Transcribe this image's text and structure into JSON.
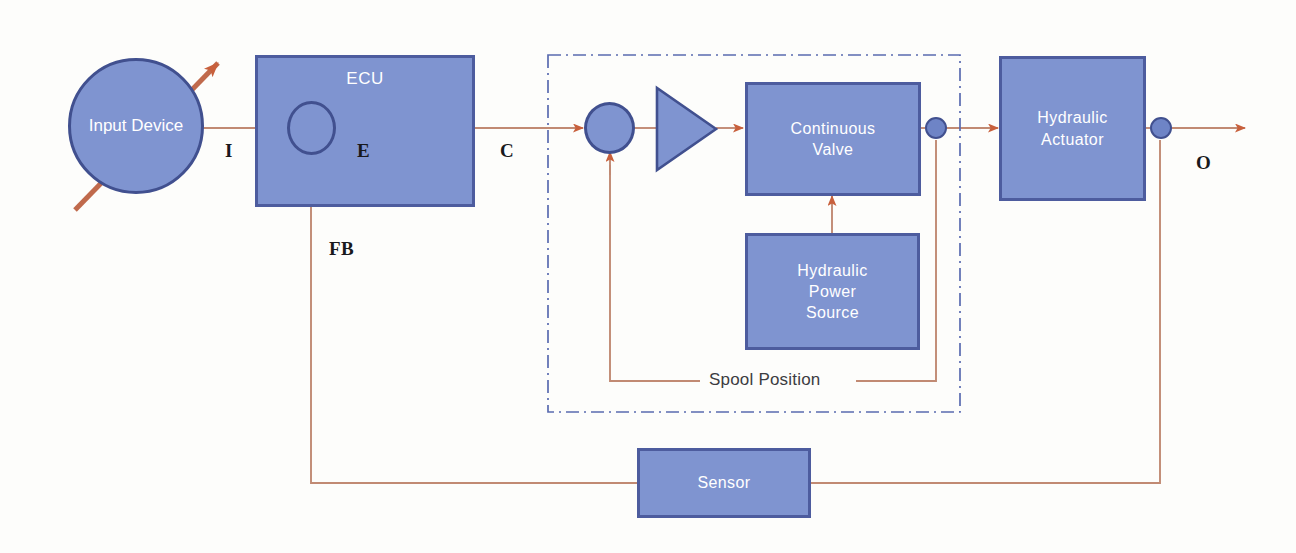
{
  "diagram": {
    "type": "block-diagram",
    "colors": {
      "block_fill": "#7f94d0",
      "block_border": "#4d5c9e",
      "signal_line": "#c18a73",
      "arrowhead": "#c8603c",
      "dashed_boundary": "#5a6bb0",
      "block_text": "#ffffff",
      "signal_label_text": "#19191c",
      "background": "#fdfdfb"
    },
    "blocks": [
      {
        "id": "input-device",
        "label": "Input Device",
        "lines": [
          "Input",
          "Device"
        ],
        "shape": "circle"
      },
      {
        "id": "ecu",
        "label": "ECU",
        "lines": [
          "ECU"
        ],
        "shape": "rect"
      },
      {
        "id": "ecu-summing",
        "label": "Summing Junction",
        "lines": [],
        "shape": "circle-cross"
      },
      {
        "id": "ecu-amplifier",
        "label": "Amplifier",
        "lines": [],
        "shape": "triangle-outline"
      },
      {
        "id": "valve-summing",
        "label": "Valve Summing Junction",
        "lines": [],
        "shape": "circle-cross"
      },
      {
        "id": "valve-amplifier",
        "label": "Valve Amplifier",
        "lines": [],
        "shape": "triangle-filled"
      },
      {
        "id": "continuous-valve",
        "label": "Continuous Valve",
        "lines": [
          "Continuous",
          "Valve"
        ],
        "shape": "rect"
      },
      {
        "id": "hydraulic-power-source",
        "label": "Hydraulic Power Source",
        "lines": [
          "Hydraulic",
          "Power",
          "Source"
        ],
        "shape": "rect"
      },
      {
        "id": "hydraulic-actuator",
        "label": "Hydraulic Actuator",
        "lines": [
          "Hydraulic",
          "Actuator"
        ],
        "shape": "rect"
      },
      {
        "id": "sensor",
        "label": "Sensor",
        "lines": [
          "Sensor"
        ],
        "shape": "rect"
      }
    ],
    "signal_labels": [
      {
        "id": "I",
        "text": "I"
      },
      {
        "id": "E",
        "text": "E"
      },
      {
        "id": "C",
        "text": "C"
      },
      {
        "id": "FB",
        "text": "FB"
      },
      {
        "id": "O",
        "text": "O"
      }
    ],
    "annotations": [
      {
        "id": "spool-position",
        "text": "Spool Position"
      }
    ],
    "boundary": {
      "id": "valve-assembly-boundary",
      "style": "dash-dot"
    }
  }
}
